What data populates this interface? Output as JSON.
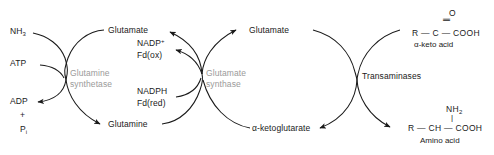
{
  "diagram": {
    "colors": {
      "text": "#1a1a1a",
      "enzyme_label": "#9a9a9a",
      "stroke": "#1a1a1a",
      "background": "#ffffff"
    },
    "cycles": [
      {
        "name": "glutamine-synthetase-cycle",
        "enzyme_line1": "Glutamine",
        "enzyme_line2": "synthetase"
      },
      {
        "name": "glutamate-synthase-cycle",
        "enzyme_line1": "Glutamate",
        "enzyme_line2": "synthase"
      },
      {
        "name": "transaminase-cycle",
        "enzyme_line1": "Transaminases",
        "enzyme_line2": ""
      }
    ],
    "labels": {
      "ammonia": "NH",
      "ammonia_sub": "3",
      "atp": "ATP",
      "adp": "ADP",
      "plus": "+",
      "phosphate": "P",
      "phosphate_sub": "i",
      "glutamate_left": "Glutamate",
      "glutamine": "Glutamine",
      "nadp_ox": "NADP",
      "nadp_ox_sup": "+",
      "fd_ox": "Fd(ox)",
      "nadph": "NADPH",
      "fd_red": "Fd(red)",
      "glutamate_right": "Glutamate",
      "ketoglutarate": "α-ketoglutarate"
    },
    "structures": {
      "keto_acid": {
        "oxygen": "O",
        "double_bond": "‖",
        "backbone": "R — C — COOH",
        "name": "α-keto acid"
      },
      "amino_acid": {
        "amine": "NH",
        "amine_sub": "2",
        "single_bond": "|",
        "backbone": "R — CH — COOH",
        "name": "Amino acid"
      }
    }
  }
}
